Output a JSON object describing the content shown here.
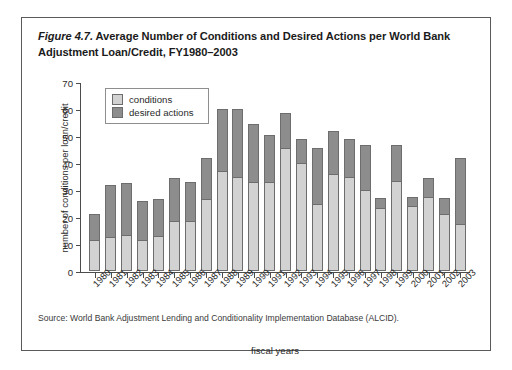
{
  "figure": {
    "number": "Figure 4.7.",
    "title_rest": " Average Number of Conditions and Desired Actions per World Bank Adjustment Loan/Credit, FY1980–2003",
    "source": "Source: World Bank Adjustment Lending and Conditionality Implementation Database (ALCID)."
  },
  "legend": {
    "items": [
      {
        "label": "conditions",
        "color": "#d2d2d2"
      },
      {
        "label": "desired actions",
        "color": "#8d8d8d"
      }
    ]
  },
  "chart_data": {
    "type": "bar",
    "stacked": true,
    "title": "Figure 4.7. Average Number of Conditions and Desired Actions per World Bank Adjustment Loan/Credit, FY1980–2003",
    "xlabel": "fiscal years",
    "ylabel": "number of conditions per loan/credit",
    "ylim": [
      0,
      70
    ],
    "yticks": [
      0,
      10,
      20,
      30,
      40,
      50,
      60,
      70
    ],
    "grid": false,
    "legend_position": "top-left-inside",
    "categories": [
      "1980",
      "1981",
      "1982",
      "1983",
      "1984",
      "1985",
      "1986",
      "1987",
      "1988",
      "1989",
      "1990",
      "1991",
      "1992",
      "1993",
      "1994",
      "1995",
      "1996",
      "1997",
      "1998",
      "1999",
      "2000",
      "2001",
      "2002",
      "2003"
    ],
    "series": [
      {
        "name": "conditions",
        "color": "#d2d2d2",
        "values": [
          11.5,
          12.5,
          13.5,
          11.5,
          13,
          18.5,
          18.5,
          26.5,
          37,
          35,
          33,
          33,
          45.5,
          40,
          25,
          36,
          35,
          30,
          23.5,
          33.5,
          24,
          27.5,
          21,
          17.5
        ]
      },
      {
        "name": "desired actions",
        "color": "#8d8d8d",
        "values": [
          9.5,
          19.5,
          19,
          14.5,
          13.5,
          16,
          14.5,
          15.5,
          23,
          25,
          21.5,
          17.5,
          13,
          9,
          20.5,
          16,
          14,
          16.5,
          3.5,
          13,
          3.5,
          7,
          6,
          24.5
        ]
      }
    ],
    "totals": [
      21,
      32,
      32.5,
      26,
      26.5,
      34.5,
      33,
      42,
      60,
      60,
      54.5,
      50.5,
      58.5,
      49,
      45.5,
      52,
      49,
      46.5,
      27,
      46.5,
      27.5,
      34.5,
      27,
      42
    ]
  }
}
